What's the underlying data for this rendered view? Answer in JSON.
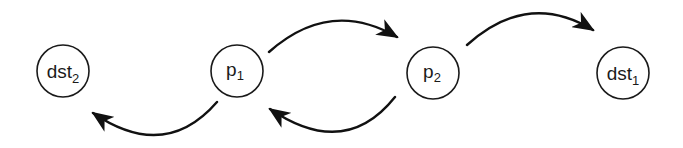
{
  "diagram": {
    "type": "state-transition",
    "colors": {
      "background": "#ffffff",
      "stroke": "#1a1a1a",
      "arrow": "#111111"
    },
    "nodes": [
      {
        "id": "dst2",
        "base": "dst",
        "sub": "2",
        "cx": 63,
        "cy": 71,
        "r": 26
      },
      {
        "id": "p1",
        "base": "p",
        "sub": "1",
        "cx": 237,
        "cy": 71,
        "r": 26
      },
      {
        "id": "p2",
        "base": "p",
        "sub": "2",
        "cx": 433,
        "cy": 73,
        "r": 26
      },
      {
        "id": "dst1",
        "base": "dst",
        "sub": "1",
        "cx": 623,
        "cy": 73,
        "r": 26
      }
    ],
    "edges": [
      {
        "from": "p1",
        "to": "p2",
        "position": "above"
      },
      {
        "from": "p2",
        "to": "p1",
        "position": "below"
      },
      {
        "from": "p1",
        "to": "dst2",
        "position": "below"
      },
      {
        "from": "p2",
        "to": "dst1",
        "position": "above"
      }
    ]
  }
}
